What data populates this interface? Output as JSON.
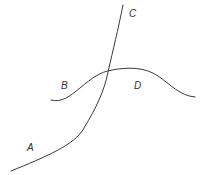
{
  "diagram": {
    "stroke_color": "#3a3a3a",
    "label_color": "#333333",
    "curves": [
      {
        "id": "curve-ac",
        "description": "Steep curve rising from lower-left (A) to top (C)",
        "path": "M 11 171 C 45 157, 75 145, 84 128 C 96 108, 104 92, 108 72 C 113 50, 118 30, 123 5"
      },
      {
        "id": "curve-bd",
        "description": "Wavy curve from left (B) through peak to right (D)",
        "path": "M 51 100 C 62 103, 70 96, 80 88 C 92 78, 100 72, 112 70 C 128 67, 145 67, 158 76 C 170 84, 180 96, 195 97"
      }
    ],
    "labels": [
      {
        "text": "C",
        "x": 129,
        "y": 9
      },
      {
        "text": "B",
        "x": 61,
        "y": 81
      },
      {
        "text": "D",
        "x": 134,
        "y": 81
      },
      {
        "text": "A",
        "x": 27,
        "y": 143
      }
    ]
  }
}
